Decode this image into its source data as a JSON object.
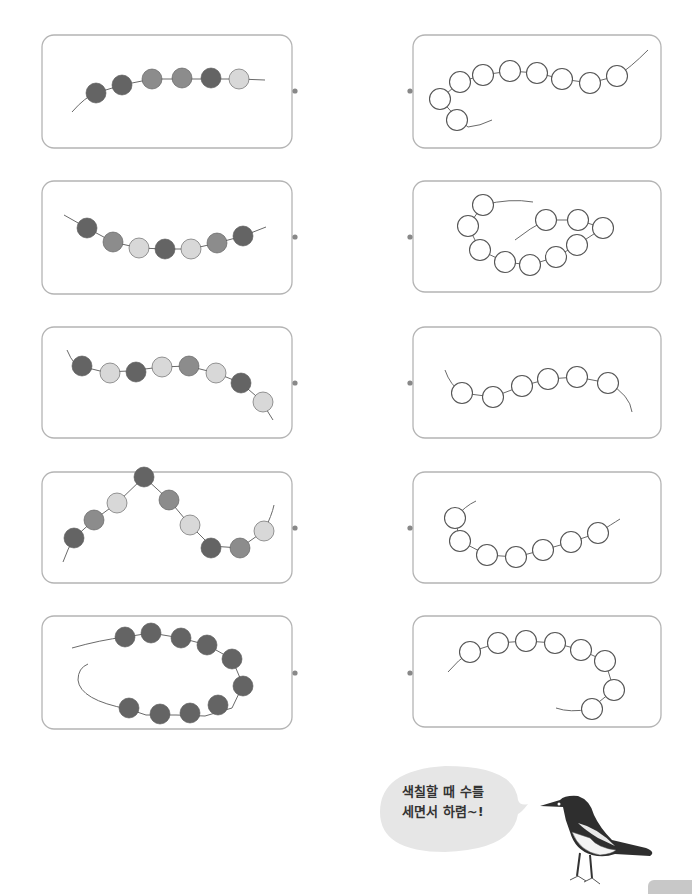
{
  "colors": {
    "panel_border": "#b4b4b4",
    "string": "#6a6a6a",
    "dot": "#888888",
    "bead_dark": "#646464",
    "bead_medium": "#8c8c8c",
    "bead_light": "#d8d8d8",
    "bead_empty_fill": "#ffffff",
    "bead_empty_stroke": "#555555",
    "bubble": "#e6e6e6",
    "page_tab": "#c8c8c8"
  },
  "bubble": {
    "line1": "색칠할 때 수를",
    "line2": "세면서 하렴~!"
  },
  "left_panels": [
    {
      "box": [
        42,
        35,
        250,
        113
      ],
      "dot": [
        295,
        91
      ],
      "string": "M72,112 Q85,97 96,93 L122,85 L152,79 L239,79 L265,80",
      "beads": [
        [
          96,
          93,
          "d"
        ],
        [
          122,
          85,
          "d"
        ],
        [
          152,
          79,
          "m"
        ],
        [
          182,
          78,
          "m"
        ],
        [
          211,
          78,
          "d"
        ],
        [
          239,
          79,
          "l"
        ]
      ]
    },
    {
      "box": [
        42,
        181,
        250,
        113
      ],
      "dot": [
        295,
        237
      ],
      "string": "M64,215 L87,228 L113,242 L139,248 L165,249 L191,249 L217,243 L243,236 L266,227",
      "beads": [
        [
          87,
          228,
          "d"
        ],
        [
          113,
          242,
          "m"
        ],
        [
          139,
          248,
          "l"
        ],
        [
          165,
          249,
          "d"
        ],
        [
          191,
          249,
          "l"
        ],
        [
          217,
          243,
          "m"
        ],
        [
          243,
          236,
          "d"
        ]
      ]
    },
    {
      "box": [
        42,
        327,
        250,
        111
      ],
      "dot": [
        295,
        383
      ],
      "string": "M67,350 Q70,358 76,365 L104,372 L129,371 L161,367 L188,366 L216,373 L241,383 L263,402 Q268,413 273,420",
      "beads": [
        [
          82,
          366,
          "d"
        ],
        [
          110,
          373,
          "l"
        ],
        [
          136,
          372,
          "d"
        ],
        [
          162,
          367,
          "l"
        ],
        [
          189,
          366,
          "m"
        ],
        [
          216,
          373,
          "l"
        ],
        [
          241,
          383,
          "d"
        ],
        [
          263,
          402,
          "l"
        ]
      ]
    },
    {
      "box": [
        42,
        472,
        250,
        111
      ],
      "dot": [
        295,
        528
      ],
      "string": "M63,562 Q68,548 74,538 L94,520 L117,503 L144,477 L169,500 L190,525 L211,546 L240,548 L264,531 Q272,515 274,505",
      "beads": [
        [
          74,
          538,
          "d"
        ],
        [
          94,
          520,
          "m"
        ],
        [
          117,
          503,
          "l"
        ],
        [
          144,
          477,
          "d"
        ],
        [
          169,
          500,
          "m"
        ],
        [
          190,
          525,
          "l"
        ],
        [
          211,
          548,
          "d"
        ],
        [
          240,
          548,
          "m"
        ],
        [
          264,
          531,
          "l"
        ]
      ]
    },
    {
      "box": [
        42,
        616,
        250,
        113
      ],
      "dot": [
        295,
        673
      ],
      "string": "M72,648 Q100,640 125,637 L151,633 L181,638 L207,645 L232,659 L243,685 L232,708 L205,716 L176,715 L146,715 L128,709 Q80,700 78,680 Q78,668 88,664",
      "beads": [
        [
          125,
          637,
          "d"
        ],
        [
          151,
          633,
          "d"
        ],
        [
          181,
          638,
          "d"
        ],
        [
          207,
          645,
          "d"
        ],
        [
          232,
          659,
          "d"
        ],
        [
          243,
          686,
          "d"
        ],
        [
          218,
          705,
          "d"
        ],
        [
          190,
          713,
          "d"
        ],
        [
          160,
          714,
          "d"
        ],
        [
          129,
          708,
          "d"
        ]
      ]
    }
  ],
  "right_panels": [
    {
      "box": [
        413,
        35,
        248,
        113
      ],
      "dot": [
        410,
        91
      ],
      "string": "M492,120 Q480,126 468,127 L457,118 L440,99 L460,82 L483,75 L510,71 L537,73 L562,79 L590,83 L617,76 Q630,68 648,50",
      "beads": [
        [
          457,
          120,
          "e"
        ],
        [
          440,
          99,
          "e"
        ],
        [
          460,
          82,
          "e"
        ],
        [
          483,
          75,
          "e"
        ],
        [
          510,
          71,
          "e"
        ],
        [
          537,
          73,
          "e"
        ],
        [
          562,
          79,
          "e"
        ],
        [
          590,
          83,
          "e"
        ],
        [
          617,
          76,
          "e"
        ]
      ]
    },
    {
      "box": [
        413,
        181,
        248,
        111
      ],
      "dot": [
        410,
        237
      ],
      "string": "M533,202 Q510,198 483,205 L468,226 L480,250 L505,262 L530,265 L556,257 L577,245 L603,228 L578,220 L546,220 Q530,228 515,240",
      "beads": [
        [
          483,
          205,
          "e"
        ],
        [
          468,
          226,
          "e"
        ],
        [
          480,
          250,
          "e"
        ],
        [
          505,
          262,
          "e"
        ],
        [
          530,
          265,
          "e"
        ],
        [
          556,
          257,
          "e"
        ],
        [
          577,
          245,
          "e"
        ],
        [
          603,
          228,
          "e"
        ],
        [
          578,
          220,
          "e"
        ],
        [
          546,
          220,
          "e"
        ]
      ]
    },
    {
      "box": [
        413,
        327,
        248,
        111
      ],
      "dot": [
        410,
        383
      ],
      "string": "M445,370 Q450,385 462,393 L493,397 L522,386 L548,379 L577,377 L608,383 Q630,395 632,412",
      "beads": [
        [
          462,
          393,
          "e"
        ],
        [
          493,
          397,
          "e"
        ],
        [
          522,
          386,
          "e"
        ],
        [
          548,
          379,
          "e"
        ],
        [
          577,
          377,
          "e"
        ],
        [
          608,
          383,
          "e"
        ]
      ]
    },
    {
      "box": [
        413,
        472,
        248,
        111
      ],
      "dot": [
        410,
        528
      ],
      "string": "M476,501 Q465,506 455,518 L460,541 L487,555 L516,557 L543,550 L571,542 L598,533 Q612,524 620,519",
      "beads": [
        [
          455,
          518,
          "e"
        ],
        [
          460,
          541,
          "e"
        ],
        [
          487,
          555,
          "e"
        ],
        [
          516,
          557,
          "e"
        ],
        [
          543,
          550,
          "e"
        ],
        [
          571,
          542,
          "e"
        ],
        [
          598,
          533,
          "e"
        ]
      ]
    },
    {
      "box": [
        413,
        616,
        248,
        111
      ],
      "dot": [
        410,
        673
      ],
      "string": "M448,672 Q458,660 470,652 L498,643 L526,641 L555,643 L581,650 L605,661 L614,690 L590,709 Q570,713 556,708",
      "beads": [
        [
          470,
          652,
          "e"
        ],
        [
          498,
          643,
          "e"
        ],
        [
          526,
          641,
          "e"
        ],
        [
          555,
          643,
          "e"
        ],
        [
          581,
          650,
          "e"
        ],
        [
          605,
          661,
          "e"
        ],
        [
          614,
          690,
          "e"
        ],
        [
          592,
          709,
          "e"
        ]
      ]
    }
  ]
}
